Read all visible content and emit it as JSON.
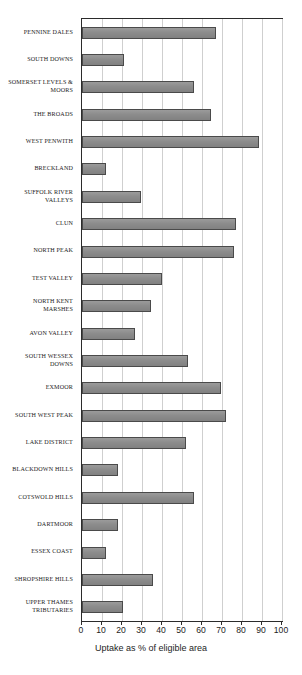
{
  "chart_data": {
    "type": "bar",
    "orientation": "horizontal",
    "title": "",
    "xlabel": "Uptake as % of eligible area",
    "ylabel": "",
    "xlim": [
      0,
      100
    ],
    "xticks": [
      0,
      10,
      20,
      30,
      40,
      50,
      60,
      70,
      80,
      90,
      100
    ],
    "grid": true,
    "legend": null,
    "categories": [
      "PENNINE DALES",
      "SOUTH DOWNS",
      "SOMERSET LEVELS &\nMOORS",
      "THE BROADS",
      "WEST PENWITH",
      "BRECKLAND",
      "SUFFOLK RIVER\nVALLEYS",
      "CLUN",
      "NORTH PEAK",
      "TEST VALLEY",
      "NORTH KENT\nMARSHES",
      "AVON VALLEY",
      "SOUTH WESSEX\nDOWNS",
      "EXMOOR",
      "SOUTH WEST PEAK",
      "LAKE DISTRICT",
      "BLACKDOWN HILLS",
      "COTSWOLD HILLS",
      "DARTMOOR",
      "ESSEX COAST",
      "SHROPSHIRE HILLS",
      "UPPER THAMES\nTRIBUTARIES"
    ],
    "values": [
      67,
      21,
      56,
      64.5,
      88.5,
      12,
      29.5,
      77,
      76,
      40,
      34.5,
      26.5,
      53,
      69.5,
      72,
      52,
      18,
      56,
      18,
      12,
      35.5,
      20.5
    ],
    "bar_color": "#8c8c8c",
    "bar_edge_color": "#4a4a4a",
    "grid_color": "#cfcfcf",
    "axis_color": "#2b2b2b"
  }
}
